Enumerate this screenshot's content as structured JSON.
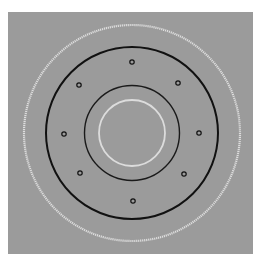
{
  "figure": {
    "width": 264,
    "height": 268,
    "page_background": "#ffffff",
    "panel": {
      "x": 8,
      "y": 12,
      "width": 245,
      "height": 242,
      "fill": "#9b9b9b"
    },
    "center": {
      "x": 132,
      "y": 133
    },
    "rings": [
      {
        "name": "outer-white-ring",
        "r": 108,
        "stroke": "#e4e4e4",
        "width": 2.2,
        "dashed": true
      },
      {
        "name": "outer-black-ring",
        "r": 86,
        "stroke": "#111111",
        "width": 2.0,
        "dashed": false
      },
      {
        "name": "inner-black-ring",
        "r": 47.5,
        "stroke": "#1a1a1a",
        "width": 1.4,
        "dashed": false
      },
      {
        "name": "inner-white-ring",
        "r": 33,
        "stroke": "#dcdcdc",
        "width": 1.8,
        "dashed": false
      }
    ],
    "markers": {
      "r": 2.2,
      "stroke": "#111111",
      "width": 1.2,
      "points": [
        {
          "x": 132,
          "y": 62
        },
        {
          "x": 178,
          "y": 83
        },
        {
          "x": 199,
          "y": 133
        },
        {
          "x": 184,
          "y": 174
        },
        {
          "x": 133,
          "y": 201
        },
        {
          "x": 80,
          "y": 173
        },
        {
          "x": 64,
          "y": 134
        },
        {
          "x": 79,
          "y": 85
        }
      ]
    }
  }
}
